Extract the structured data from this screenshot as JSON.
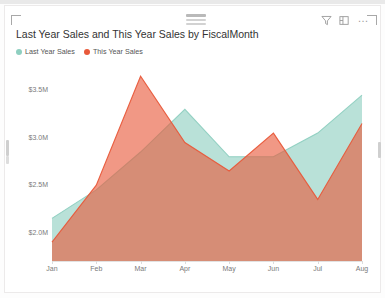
{
  "visual": {
    "title": "Last Year Sales and This Year Sales by FiscalMonth",
    "grip": "drag-handle",
    "icons": {
      "filter": "filter-icon",
      "focus": "focus-mode-icon",
      "more": "…"
    }
  },
  "legend": {
    "items": [
      {
        "label": "Last Year Sales",
        "color": "#8ecfc0"
      },
      {
        "label": "This Year Sales",
        "color": "#e8593a"
      }
    ]
  },
  "chart_data": {
    "type": "area",
    "title": "Last Year Sales and This Year Sales by FiscalMonth",
    "xlabel": "FiscalMonth",
    "ylabel": "",
    "grid": false,
    "legend_position": "top-left",
    "categories": [
      "Jan",
      "Feb",
      "Mar",
      "Apr",
      "May",
      "Jun",
      "Jul",
      "Aug"
    ],
    "yticks": [
      "$2.0M",
      "$2.5M",
      "$3.0M",
      "$3.5M"
    ],
    "ytick_values": [
      2000000,
      2500000,
      3000000,
      3500000
    ],
    "ylim": [
      1700000,
      3800000
    ],
    "series": [
      {
        "name": "Last Year Sales",
        "color": "#8ecfc0",
        "values": [
          2150000,
          2450000,
          2850000,
          3300000,
          2800000,
          2800000,
          3050000,
          3450000
        ]
      },
      {
        "name": "This Year Sales",
        "color": "#e8593a",
        "values": [
          1900000,
          2500000,
          3650000,
          2950000,
          2650000,
          3050000,
          2350000,
          3150000
        ]
      }
    ]
  }
}
